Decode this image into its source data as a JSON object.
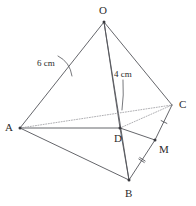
{
  "figure": {
    "canvas": {
      "width": 196,
      "height": 206
    },
    "stroke_color": "#54555a",
    "dotted_color": "#9a9aa0",
    "text_color": "#2b2b2b"
  },
  "vertices": [
    {
      "id": "O",
      "label": "O",
      "x": 104,
      "y": 22,
      "label_x": 99,
      "label_y": 5,
      "dot": true
    },
    {
      "id": "A",
      "label": "A",
      "x": 20,
      "y": 128,
      "label_x": 5,
      "label_y": 122,
      "dot": true
    },
    {
      "id": "B",
      "label": "B",
      "x": 129,
      "y": 180,
      "label_x": 125,
      "label_y": 188,
      "dot": true
    },
    {
      "id": "C",
      "label": "C",
      "x": 172,
      "y": 105,
      "label_x": 179,
      "label_y": 99,
      "dot": false
    },
    {
      "id": "D",
      "label": "D",
      "x": 120,
      "y": 128,
      "label_x": 114,
      "label_y": 133,
      "dot": true
    },
    {
      "id": "M",
      "label": "M",
      "x": 155,
      "y": 140,
      "label_x": 159,
      "label_y": 144,
      "dot": true
    }
  ],
  "edges": [
    {
      "id": "OA",
      "from": "O",
      "to": "A",
      "style": "solid"
    },
    {
      "id": "OB",
      "from": "O",
      "to": "B",
      "style": "solid"
    },
    {
      "id": "OC",
      "from": "O",
      "to": "C",
      "style": "solid"
    },
    {
      "id": "OD",
      "from": "O",
      "to": "D",
      "style": "solid"
    },
    {
      "id": "AB",
      "from": "A",
      "to": "B",
      "style": "solid"
    },
    {
      "id": "AD",
      "from": "A",
      "to": "D",
      "style": "solid"
    },
    {
      "id": "AC",
      "from": "A",
      "to": "C",
      "style": "dotted"
    },
    {
      "id": "BD",
      "from": "B",
      "to": "D",
      "style": "solid"
    },
    {
      "id": "BM",
      "from": "B",
      "to": "M",
      "style": "solid"
    },
    {
      "id": "MC",
      "from": "M",
      "to": "C",
      "style": "solid"
    },
    {
      "id": "DM",
      "from": "D",
      "to": "M",
      "style": "solid"
    },
    {
      "id": "DC",
      "from": "D",
      "to": "C",
      "style": "dotted"
    }
  ],
  "tick_marks": [
    {
      "id": "tick-BM",
      "on_edge": "BM",
      "count": 2,
      "x": 142,
      "y": 160
    },
    {
      "id": "tick-MC",
      "on_edge": "MC",
      "count": 1,
      "x": 164,
      "y": 122
    }
  ],
  "measurements": [
    {
      "id": "length-OA",
      "text": "6 cm",
      "label_x": 37,
      "label_y": 59,
      "leader": {
        "x1": 58,
        "y1": 56,
        "cx": 70,
        "cy": 62,
        "x2": 72,
        "y2": 76
      }
    },
    {
      "id": "length-OD",
      "text": "4 cm",
      "label_x": 114,
      "label_y": 70,
      "leader": {
        "x1": 123,
        "y1": 80,
        "cx": 124,
        "cy": 95,
        "x2": 122,
        "y2": 110
      }
    }
  ]
}
